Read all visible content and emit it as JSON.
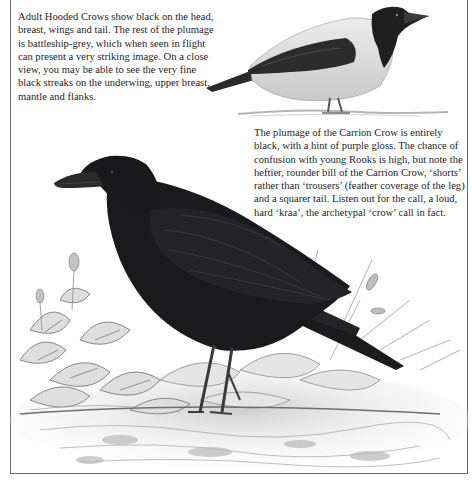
{
  "page": {
    "captions": {
      "hooded_crow": "Adult Hooded Crows show black on the head, breast, wings and tail. The rest of the plumage is battleship-grey, which when seen in flight can present a very striking image. On a close view, you may be able to see the very fine black streaks on the underwing, upper breast, mantle and flanks.",
      "carrion_crow": "The plumage of the Carrion Crow is entirely black, with a hint of purple gloss. The chance of confusion with young Rooks is high, but note the heftier, rounder bill of the Carrion Crow, ‘shorts’ rather than ‘trousers’ (feather coverage of the leg) and a squarer tail. Listen out for the call, a loud, hard ‘kraa’, the archetypal ‘crow’ call in fact."
    },
    "illustrations": {
      "hooded_crow": "hooded-crow-illustration",
      "carrion_crow": "carrion-crow-illustration"
    },
    "colors": {
      "ink": "#1e1e1e",
      "crow_black": "#1a1a1c",
      "hooded_grey": "#d9d9d9",
      "frame": "#6b6b6b"
    }
  }
}
